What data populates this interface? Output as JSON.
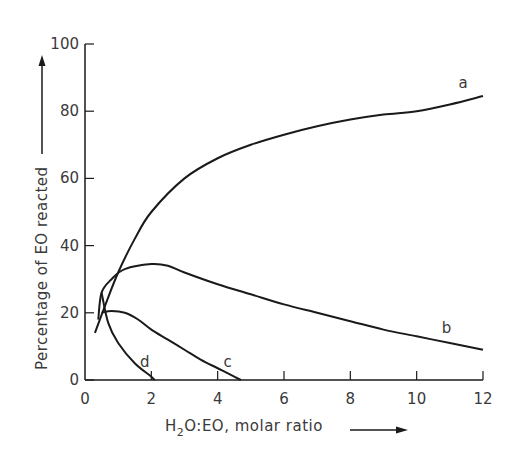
{
  "chart_data": {
    "type": "line",
    "title": "",
    "xlabel": "H2O:EO, molar ratio",
    "ylabel": "Percentage of EO reacted",
    "xlim": [
      0,
      12
    ],
    "ylim": [
      0,
      100
    ],
    "x_ticks": [
      0,
      2,
      4,
      6,
      8,
      10,
      12
    ],
    "y_ticks": [
      0,
      20,
      40,
      60,
      80,
      100
    ],
    "grid": false,
    "legend": "inline curve labels",
    "series": [
      {
        "name": "a",
        "x": [
          0.3,
          0.6,
          1.0,
          1.5,
          2.0,
          3.0,
          4.0,
          5.0,
          6.0,
          7.0,
          8.0,
          9.0,
          10.0,
          11.0,
          12.0
        ],
        "y": [
          14,
          22,
          32,
          42,
          50,
          60,
          66,
          70,
          73,
          75.5,
          77.5,
          79,
          80,
          82,
          84.5
        ]
      },
      {
        "name": "b",
        "x": [
          0.4,
          0.5,
          0.8,
          1.2,
          2.0,
          2.5,
          3.0,
          4.0,
          5.0,
          6.0,
          7.0,
          8.0,
          9.0,
          10.0,
          11.0,
          12.0
        ],
        "y": [
          18,
          26,
          30,
          33,
          34.5,
          34,
          32,
          28.5,
          25.5,
          22.5,
          20,
          17.5,
          15,
          13,
          11,
          9
        ]
      },
      {
        "name": "c",
        "x": [
          0.5,
          0.8,
          1.2,
          1.6,
          2.0,
          2.5,
          3.0,
          3.5,
          4.0,
          4.5,
          4.7
        ],
        "y": [
          20,
          20.5,
          20,
          18,
          15,
          12,
          9,
          6,
          3.5,
          1,
          0
        ]
      },
      {
        "name": "d",
        "x": [
          0.5,
          0.7,
          1.0,
          1.5,
          2.0,
          2.1
        ],
        "y": [
          26,
          17,
          11,
          5,
          1,
          0
        ]
      }
    ],
    "annotations": [
      {
        "text": "a",
        "x": 11.4,
        "y": 87
      },
      {
        "text": "b",
        "x": 10.9,
        "y": 14
      },
      {
        "text": "c",
        "x": 4.3,
        "y": 4
      },
      {
        "text": "d",
        "x": 1.8,
        "y": 4
      }
    ]
  },
  "axes": {
    "x_title_prefix": "H",
    "x_title_sub": "2",
    "x_title_rest": "O:EO, molar ratio",
    "y_title": "Percentage of EO reacted"
  }
}
